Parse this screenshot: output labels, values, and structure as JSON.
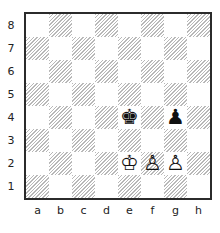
{
  "board": {
    "files": [
      "a",
      "b",
      "c",
      "d",
      "e",
      "f",
      "g",
      "h"
    ],
    "ranks": [
      "8",
      "7",
      "6",
      "5",
      "4",
      "3",
      "2",
      "1"
    ],
    "colors": {
      "border": "#2b2b2b",
      "light_square": "#ffffff",
      "dark_hatch": "#b8b8b8",
      "label": "#222222",
      "piece": "#111111"
    },
    "pieces": [
      {
        "square": "e4",
        "name": "black-king",
        "glyph": "♚",
        "color": "black"
      },
      {
        "square": "g4",
        "name": "black-pawn",
        "glyph": "♟",
        "color": "black"
      },
      {
        "square": "e2",
        "name": "white-king",
        "glyph": "♔",
        "color": "white"
      },
      {
        "square": "f2",
        "name": "white-pawn",
        "glyph": "♙",
        "color": "white"
      },
      {
        "square": "g2",
        "name": "white-pawn",
        "glyph": "♙",
        "color": "white"
      }
    ]
  }
}
